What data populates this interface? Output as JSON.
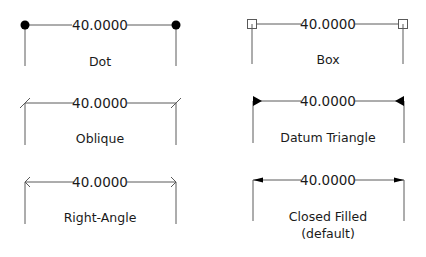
{
  "diagram": {
    "dimension_value": "40.0000",
    "items": [
      {
        "label": "Dot",
        "arrowhead": "dot",
        "value": "40.0000"
      },
      {
        "label": "Box",
        "arrowhead": "box",
        "value": "40.0000"
      },
      {
        "label": "Oblique",
        "arrowhead": "oblique",
        "value": "40.0000"
      },
      {
        "label": "Datum Triangle",
        "arrowhead": "datum-triangle",
        "value": "40.0000"
      },
      {
        "label": "Right-Angle",
        "arrowhead": "right-angle",
        "value": "40.0000"
      },
      {
        "label": "Closed Filled",
        "label_line2": "(default)",
        "arrowhead": "closed-filled",
        "value": "40.0000"
      }
    ],
    "colors": {
      "line": "#5a5a5a",
      "text": "#1a1a1a",
      "fill": "#000000",
      "background": "#ffffff"
    }
  }
}
